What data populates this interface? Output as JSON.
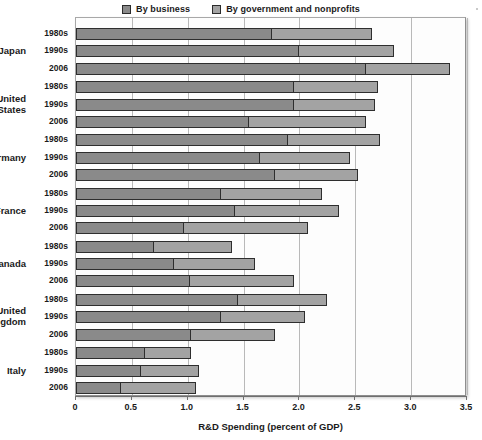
{
  "legend": {
    "items": [
      {
        "label": "By business",
        "color": "#8a8a8a",
        "key": "business"
      },
      {
        "label": "By government and nonprofits",
        "color": "#a3a3a3",
        "key": "government"
      }
    ]
  },
  "axis": {
    "xlabel": "R&D Spending (percent of GDP)",
    "ticks": [
      "0",
      "0.5",
      "1.0",
      "1.5",
      "2.0",
      "2.5",
      "3.0",
      "3.5"
    ],
    "tick_values": [
      0,
      0.5,
      1.0,
      1.5,
      2.0,
      2.5,
      3.0,
      3.5
    ],
    "xmin": 0,
    "xmax": 3.5
  },
  "chart_data": {
    "type": "bar",
    "orientation": "horizontal",
    "stacked": true,
    "title": "",
    "xlabel": "R&D Spending (percent of GDP)",
    "ylabel": "",
    "xlim": [
      0,
      3.5
    ],
    "grid": true,
    "legend_position": "top-center",
    "series": [
      {
        "name": "By business",
        "color": "#8a8a8a"
      },
      {
        "name": "By government and nonprofits",
        "color": "#a3a3a3"
      }
    ],
    "groups": [
      {
        "country": "Japan",
        "rows": [
          {
            "period": "1980s",
            "business": 1.75,
            "government": 0.9,
            "total": 2.65
          },
          {
            "period": "1990s",
            "business": 2.0,
            "government": 0.85,
            "total": 2.85
          },
          {
            "period": "2006",
            "business": 2.6,
            "government": 0.75,
            "total": 3.35
          }
        ]
      },
      {
        "country": "United States",
        "rows": [
          {
            "period": "1980s",
            "business": 1.95,
            "government": 0.75,
            "total": 2.7
          },
          {
            "period": "1990s",
            "business": 1.95,
            "government": 0.73,
            "total": 2.68
          },
          {
            "period": "2006",
            "business": 1.55,
            "government": 1.05,
            "total": 2.6
          }
        ]
      },
      {
        "country": "Germany",
        "rows": [
          {
            "period": "1980s",
            "business": 1.9,
            "government": 0.82,
            "total": 2.72
          },
          {
            "period": "1990s",
            "business": 1.65,
            "government": 0.8,
            "total": 2.45
          },
          {
            "period": "2006",
            "business": 1.78,
            "government": 0.74,
            "total": 2.52
          }
        ]
      },
      {
        "country": "France",
        "rows": [
          {
            "period": "1980s",
            "business": 1.3,
            "government": 0.9,
            "total": 2.2
          },
          {
            "period": "1990s",
            "business": 1.42,
            "government": 0.93,
            "total": 2.35
          },
          {
            "period": "2006",
            "business": 0.97,
            "government": 1.11,
            "total": 2.08
          }
        ]
      },
      {
        "country": "Canada",
        "rows": [
          {
            "period": "1980s",
            "business": 0.7,
            "government": 0.7,
            "total": 1.4
          },
          {
            "period": "1990s",
            "business": 0.88,
            "government": 0.72,
            "total": 1.6
          },
          {
            "period": "2006",
            "business": 1.02,
            "government": 0.93,
            "total": 1.95
          }
        ]
      },
      {
        "country": "United Kingdom",
        "rows": [
          {
            "period": "1980s",
            "business": 1.45,
            "government": 0.8,
            "total": 2.25
          },
          {
            "period": "1990s",
            "business": 1.3,
            "government": 0.75,
            "total": 2.05
          },
          {
            "period": "2006",
            "business": 1.03,
            "government": 0.75,
            "total": 1.78
          }
        ]
      },
      {
        "country": "Italy",
        "rows": [
          {
            "period": "1980s",
            "business": 0.62,
            "government": 0.41,
            "total": 1.03
          },
          {
            "period": "1990s",
            "business": 0.58,
            "government": 0.52,
            "total": 1.1
          },
          {
            "period": "2006",
            "business": 0.4,
            "government": 0.67,
            "total": 1.07
          }
        ]
      }
    ]
  }
}
